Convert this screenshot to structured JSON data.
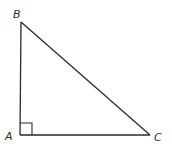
{
  "diagram": {
    "stroke_color": "#2a2a2a",
    "background": "#ffffff",
    "vertices": {
      "A": {
        "label": "A",
        "x": 20,
        "y": 135
      },
      "B": {
        "label": "B",
        "x": 21,
        "y": 22
      },
      "C": {
        "label": "C",
        "x": 150,
        "y": 135
      }
    },
    "right_angle_at": "A",
    "right_angle_marker_size": 12,
    "sides": [
      {
        "name": "AB",
        "from": "A",
        "to": "B"
      },
      {
        "name": "BC",
        "from": "B",
        "to": "C"
      },
      {
        "name": "AC",
        "from": "A",
        "to": "C"
      }
    ]
  }
}
